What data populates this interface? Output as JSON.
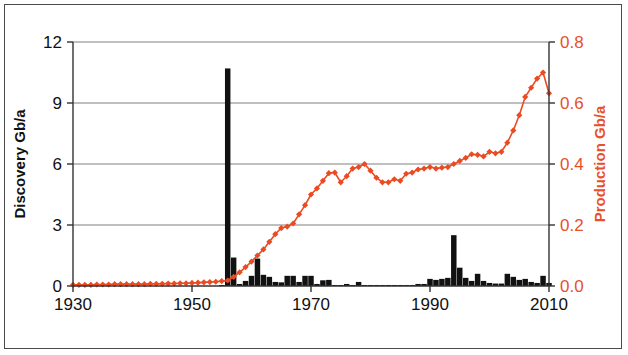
{
  "chart_data": {
    "type": "line",
    "title": "",
    "subtitle": "",
    "xlabel": "",
    "ylabel": "Discovery Gb/a",
    "y2label": "Production Gb/a",
    "xlim": [
      1930,
      2010
    ],
    "ylim": [
      0,
      12
    ],
    "y2lim": [
      0.0,
      0.8
    ],
    "xticks": [
      "1930",
      "1950",
      "1970",
      "1990",
      "2010"
    ],
    "xtick_values": [
      1930,
      1950,
      1970,
      1990,
      2010
    ],
    "yticks": [
      "0",
      "3",
      "6",
      "9",
      "12"
    ],
    "ytick_values": [
      0,
      3,
      6,
      9,
      12
    ],
    "y2ticks": [
      "0.0",
      "0.2",
      "0.4",
      "0.6",
      "0.8"
    ],
    "y2tick_values": [
      0.0,
      0.2,
      0.4,
      0.6,
      0.8
    ],
    "grid": true,
    "grid_axis": "y",
    "legend": "none",
    "colors": {
      "discovery_bars": "#111111",
      "production_line": "#EB4B22",
      "production_axis_text": "#E8502A",
      "discovery_axis_text": "#111111",
      "gridline": "#808080",
      "axis": "#333333",
      "frame": "#4a4a4a",
      "background": "#ffffff"
    },
    "series": [
      {
        "name": "Discovery Gb/a",
        "axis": "left",
        "type": "bar",
        "x": [
          1930,
          1931,
          1932,
          1933,
          1934,
          1935,
          1936,
          1937,
          1938,
          1939,
          1940,
          1941,
          1942,
          1943,
          1944,
          1945,
          1946,
          1947,
          1948,
          1949,
          1950,
          1951,
          1952,
          1953,
          1954,
          1955,
          1956,
          1957,
          1958,
          1959,
          1960,
          1961,
          1962,
          1963,
          1964,
          1965,
          1966,
          1967,
          1968,
          1969,
          1970,
          1971,
          1972,
          1973,
          1974,
          1975,
          1976,
          1977,
          1978,
          1979,
          1980,
          1981,
          1982,
          1983,
          1984,
          1985,
          1986,
          1987,
          1988,
          1989,
          1990,
          1991,
          1992,
          1993,
          1994,
          1995,
          1996,
          1997,
          1998,
          1999,
          2000,
          2001,
          2002,
          2003,
          2004,
          2005,
          2006,
          2007,
          2008,
          2009,
          2010
        ],
        "values": [
          0,
          0,
          0,
          0,
          0,
          0,
          0,
          0,
          0,
          0,
          0,
          0,
          0,
          0,
          0,
          0,
          0,
          0,
          0,
          0,
          0,
          0,
          0,
          0,
          0,
          0.05,
          10.7,
          1.4,
          0.1,
          0.25,
          0.5,
          1.35,
          0.55,
          0.45,
          0.2,
          0.18,
          0.5,
          0.5,
          0.2,
          0.5,
          0.5,
          0.1,
          0.28,
          0.3,
          0.05,
          0.05,
          0.1,
          0.05,
          0.2,
          0.05,
          0.05,
          0.05,
          0.05,
          0.05,
          0.05,
          0.05,
          0.05,
          0.05,
          0.1,
          0.1,
          0.35,
          0.3,
          0.35,
          0.4,
          2.5,
          0.9,
          0.4,
          0.25,
          0.6,
          0.25,
          0.15,
          0.12,
          0.12,
          0.6,
          0.45,
          0.3,
          0.35,
          0.2,
          0.15,
          0.5,
          0.15
        ]
      },
      {
        "name": "Production Gb/a",
        "axis": "right",
        "type": "line",
        "marker": "diamond",
        "x": [
          1930,
          1931,
          1932,
          1933,
          1934,
          1935,
          1936,
          1937,
          1938,
          1939,
          1940,
          1941,
          1942,
          1943,
          1944,
          1945,
          1946,
          1947,
          1948,
          1949,
          1950,
          1951,
          1952,
          1953,
          1954,
          1955,
          1956,
          1957,
          1958,
          1959,
          1960,
          1961,
          1962,
          1963,
          1964,
          1965,
          1966,
          1967,
          1968,
          1969,
          1970,
          1971,
          1972,
          1973,
          1974,
          1975,
          1976,
          1977,
          1978,
          1979,
          1980,
          1981,
          1982,
          1983,
          1984,
          1985,
          1986,
          1987,
          1988,
          1989,
          1990,
          1991,
          1992,
          1993,
          1994,
          1995,
          1996,
          1997,
          1998,
          1999,
          2000,
          2001,
          2002,
          2003,
          2004,
          2005,
          2006,
          2007,
          2008,
          2009,
          2010
        ],
        "values": [
          0.004,
          0.004,
          0.004,
          0.004,
          0.005,
          0.005,
          0.005,
          0.006,
          0.006,
          0.006,
          0.006,
          0.006,
          0.006,
          0.007,
          0.007,
          0.007,
          0.008,
          0.008,
          0.009,
          0.009,
          0.01,
          0.011,
          0.012,
          0.013,
          0.014,
          0.016,
          0.018,
          0.03,
          0.045,
          0.062,
          0.08,
          0.1,
          0.12,
          0.145,
          0.17,
          0.19,
          0.195,
          0.205,
          0.235,
          0.265,
          0.3,
          0.32,
          0.345,
          0.37,
          0.372,
          0.34,
          0.36,
          0.385,
          0.39,
          0.4,
          0.378,
          0.355,
          0.34,
          0.34,
          0.35,
          0.345,
          0.368,
          0.372,
          0.382,
          0.385,
          0.39,
          0.385,
          0.388,
          0.39,
          0.4,
          0.41,
          0.42,
          0.432,
          0.43,
          0.425,
          0.44,
          0.435,
          0.44,
          0.47,
          0.51,
          0.56,
          0.62,
          0.65,
          0.68,
          0.7,
          0.632
        ]
      }
    ],
    "annotations": []
  }
}
